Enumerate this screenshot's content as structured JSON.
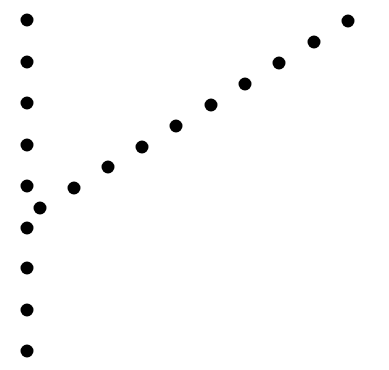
{
  "figure": {
    "dot_color": "#000000",
    "background": "#ffffff",
    "dot_diameter": 13
  },
  "vertical_column": [
    {
      "x": 27,
      "y": 20
    },
    {
      "x": 27,
      "y": 62
    },
    {
      "x": 27,
      "y": 103
    },
    {
      "x": 27,
      "y": 145
    },
    {
      "x": 27,
      "y": 186
    },
    {
      "x": 27,
      "y": 228
    },
    {
      "x": 27,
      "y": 268
    },
    {
      "x": 27,
      "y": 310
    },
    {
      "x": 27,
      "y": 351
    }
  ],
  "diagonal_line": [
    {
      "x": 40,
      "y": 208
    },
    {
      "x": 74,
      "y": 188
    },
    {
      "x": 108,
      "y": 167
    },
    {
      "x": 142,
      "y": 147
    },
    {
      "x": 176,
      "y": 126
    },
    {
      "x": 211,
      "y": 105
    },
    {
      "x": 245,
      "y": 84
    },
    {
      "x": 279,
      "y": 63
    },
    {
      "x": 314,
      "y": 42
    },
    {
      "x": 348,
      "y": 21
    }
  ]
}
